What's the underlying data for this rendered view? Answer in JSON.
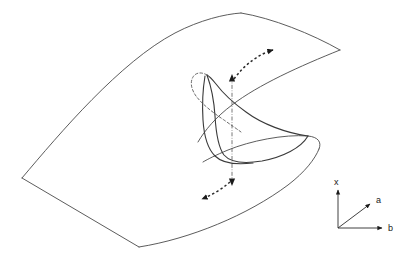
{
  "figure": {
    "colors": {
      "surface_edge": "#4a4a4a",
      "fold_curve": "#3a3a3a",
      "hidden_curve": "#5a5a5a",
      "axis": "#2b2b2b",
      "arrow": "#1a1a1a",
      "background": "#ffffff"
    },
    "axes": {
      "name": "axis-triad",
      "x_label": "x",
      "a_label": "a",
      "b_label": "b",
      "origin": [
        338,
        228
      ],
      "x_tip": [
        338,
        186
      ],
      "a_tip": [
        374,
        202
      ],
      "b_tip": [
        386,
        228
      ]
    },
    "surface": {
      "name": "equilibrium-surface",
      "vertices": {
        "left_corner": [
          22,
          178
        ],
        "top_vertex": [
          241,
          13
        ],
        "right_corner": [
          340,
          50
        ],
        "bottom_vertex": [
          139,
          247
        ],
        "fold_tip_right": [
          319,
          148
        ]
      }
    },
    "annotations": {
      "vertical_line": {
        "name": "vertical-jump-line",
        "top": [
          232,
          77
        ],
        "bottom": [
          232,
          183
        ]
      },
      "upper_arrow": {
        "name": "upper-transition-arrow",
        "from": [
          233,
          80
        ],
        "to": [
          278,
          50
        ],
        "direction": "up-right"
      },
      "lower_arrow": {
        "name": "lower-transition-arrow",
        "from": [
          231,
          181
        ],
        "to": [
          196,
          201
        ],
        "direction": "down-left"
      }
    }
  }
}
